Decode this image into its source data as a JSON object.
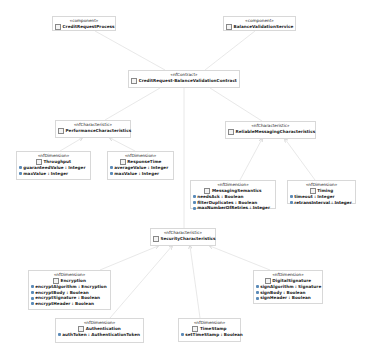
{
  "diagram": {
    "type": "UML class/component diagram",
    "colors": {
      "background": "#ffffff",
      "border": "#d8d8d8",
      "line": "#dcdcdc",
      "text": "#222222",
      "attr_icon": "#5a8ab8"
    },
    "nodes": {
      "creditRequestProcess": {
        "stereotype": "«component»",
        "name": "CreditRequestProcess",
        "attributes": []
      },
      "balanceValidationService": {
        "stereotype": "«component»",
        "name": "BalanceValidationService",
        "attributes": []
      },
      "contract": {
        "stereotype": "«nfContract»",
        "name": "CreditRequest-BalanceValidationContract",
        "attributes": []
      },
      "performance": {
        "stereotype": "«nfCharacteristic»",
        "name": "PerformanceCharacteristics",
        "attributes": []
      },
      "throughput": {
        "stereotype": "«nfDimension»",
        "name": "Throughput",
        "attributes": [
          "guaranteedValue : Integer",
          "maxValue : Integer"
        ]
      },
      "responseTime": {
        "stereotype": "«nfDimension»",
        "name": "ResponseTime",
        "attributes": [
          "averageValue : Integer",
          "maxValue : Integer"
        ]
      },
      "reliableMessaging": {
        "stereotype": "«nfCharacteristic»",
        "name": "ReliableMessagingCharacteristics",
        "attributes": []
      },
      "messagingSemantics": {
        "stereotype": "«nfDimension»",
        "name": "MessagingSemantics",
        "attributes": [
          "needsAck : Boolean",
          "filterDuplicates : Boolean",
          "maxNumberOfRetries : Integer"
        ]
      },
      "timing": {
        "stereotype": "«nfDimension»",
        "name": "Timing",
        "attributes": [
          "timeout : Integer",
          "retransInterval : Integer"
        ]
      },
      "security": {
        "stereotype": "«nfCharacteristic»",
        "name": "SecurityCharacteristics",
        "attributes": []
      },
      "encryption": {
        "stereotype": "«nfDimension»",
        "name": "Encryption",
        "attributes": [
          "encryptAlgorithm : Encryption",
          "encryptBody : Boolean",
          "encryptSignature : Boolean",
          "encryptHeader : Boolean"
        ]
      },
      "digitalSignature": {
        "stereotype": "«nfDimension»",
        "name": "DigitalSignature",
        "attributes": [
          "signAlgorithm : Signature",
          "signBody : Boolean",
          "signHeader : Boolean"
        ]
      },
      "authentication": {
        "stereotype": "«nfDimension»",
        "name": "Authentication",
        "attributes": [
          "authToken : AuthenticationToken"
        ]
      },
      "timeStamp": {
        "stereotype": "«nfDimension»",
        "name": "TimeStamp",
        "attributes": [
          "setTimeStamp : Boolean"
        ]
      }
    },
    "edges": [
      {
        "from": "creditRequestProcess",
        "to": "contract"
      },
      {
        "from": "balanceValidationService",
        "to": "contract"
      },
      {
        "from": "contract",
        "to": "performance"
      },
      {
        "from": "contract",
        "to": "security"
      },
      {
        "from": "contract",
        "to": "reliableMessaging"
      },
      {
        "from": "throughput",
        "to": "performance",
        "arrow": true
      },
      {
        "from": "responseTime",
        "to": "performance",
        "arrow": true
      },
      {
        "from": "messagingSemantics",
        "to": "reliableMessaging",
        "arrow": true
      },
      {
        "from": "timing",
        "to": "reliableMessaging",
        "arrow": true
      },
      {
        "from": "encryption",
        "to": "security",
        "arrow": true
      },
      {
        "from": "authentication",
        "to": "security",
        "arrow": true
      },
      {
        "from": "timeStamp",
        "to": "security",
        "arrow": true
      },
      {
        "from": "digitalSignature",
        "to": "security",
        "arrow": true
      }
    ]
  }
}
